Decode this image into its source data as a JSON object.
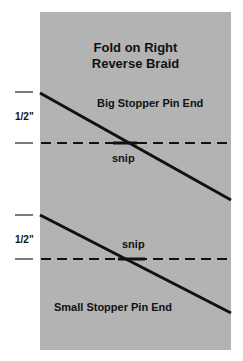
{
  "diagram": {
    "title_line1": "Fold on Right",
    "title_line2": "Reverse Braid",
    "big_end_label": "Big Stopper Pin End",
    "small_end_label": "Small Stopper Pin End",
    "snip_label_top": "snip",
    "snip_label_bottom": "snip",
    "measure_label_top": "1/2\"",
    "measure_label_bottom": "1/2\"",
    "colors": {
      "panel": "#b3b3b3",
      "lines": "#111111",
      "background": "#ffffff"
    }
  }
}
